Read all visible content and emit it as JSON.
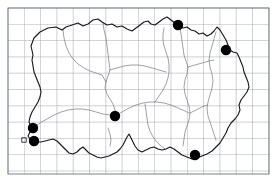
{
  "figure": {
    "kind": "distribution-dot-map",
    "title": "",
    "caption": "",
    "background_color": "#ffffff"
  },
  "colors": {
    "grid_line": "#9aa3b0",
    "grid_frame": "#6b7280",
    "coastline": "#1a1a1a",
    "internal_boundary": "#6e6e6e",
    "record_dot": "#000000"
  },
  "grid": {
    "visible": true,
    "x0": 8,
    "y0": 8,
    "x1": 269,
    "y1": 174,
    "cell_size": 16.3,
    "columns": 16,
    "rows": 10,
    "frame_visible": true
  },
  "chart_data": {
    "type": "scatter",
    "title": "",
    "xlabel": "",
    "ylabel": "",
    "xlim": [
      8,
      269
    ],
    "ylim": [
      8,
      174
    ],
    "grid": true,
    "legend": null,
    "series": [
      {
        "name": "records",
        "marker": "filled-circle",
        "marker_size": 5.2,
        "color": "#000000",
        "points": [
          {
            "label": "record-1",
            "x": 178,
            "y": 25
          },
          {
            "label": "record-2",
            "x": 226,
            "y": 50
          },
          {
            "label": "record-3",
            "x": 115,
            "y": 116
          },
          {
            "label": "record-4",
            "x": 33,
            "y": 128
          },
          {
            "label": "record-5",
            "x": 34,
            "y": 141
          },
          {
            "label": "record-6",
            "x": 195,
            "y": 155
          }
        ]
      },
      {
        "name": "minor-records",
        "marker": "open-square",
        "marker_size": 2.2,
        "color": "#111111",
        "points": [
          {
            "label": "minor-1",
            "x": 24,
            "y": 140
          }
        ]
      }
    ]
  },
  "map_geometry": {
    "coastline_label": "region-coastline",
    "coastline_path": "M 33 55 L 31 46 L 34 38 L 40 32 L 48 28 L 56 27 L 62 30 L 66 27 L 72 25 L 78 23 L 83 26 L 88 24 L 93 20 L 98 19 L 102 22 L 107 25 L 112 24 L 117 27 L 122 26 L 127 29 L 132 31 L 136 28 L 140 25 L 144 22 L 148 21 L 151 24 L 155 25 L 159 22 L 163 19 L 167 17 L 171 20 L 175 23 L 179 26 L 183 28 L 187 27 L 191 30 L 195 31 L 199 34 L 203 33 L 207 36 L 211 34 L 214 31 L 217 27 L 220 30 L 223 35 L 226 40 L 228 45 L 230 50 L 233 52 L 237 53 L 239 57 L 241 62 L 243 67 L 244 72 L 246 77 L 248 82 L 249 87 L 247 92 L 244 96 L 241 100 L 239 105 L 240 110 L 238 115 L 235 119 L 231 123 L 228 128 L 226 133 L 223 138 L 220 143 L 216 147 L 212 151 L 207 154 L 202 156 L 197 158 L 192 159 L 187 157 L 182 155 L 178 152 L 174 149 L 170 147 L 166 149 L 162 150 L 158 149 L 154 147 L 150 148 L 146 150 L 142 152 L 138 150 L 135 146 L 133 142 L 131 138 L 129 134 L 127 137 L 125 141 L 123 145 L 120 149 L 117 152 L 113 154 L 109 156 L 105 157 L 101 158 L 97 157 L 93 155 L 89 153 L 86 150 L 83 147 L 80 149 L 77 152 L 73 154 L 69 153 L 66 150 L 63 147 L 60 144 L 57 141 L 53 139 L 49 140 L 45 141 L 41 142 L 37 142 L 33 141 L 30 139 L 28 136 L 30 132 L 33 129 L 31 126 L 29 122 L 30 117 L 32 112 L 35 107 L 38 102 L 40 97 L 41 92 L 40 87 L 38 82 L 36 77 L 34 72 L 33 66 L 32 60 Z",
    "boundaries": [
      {
        "label": "boundary-north-central",
        "path": "M 103 23 L 104 30 L 106 38 L 107 46 L 108 54 L 109 62 L 110 70 L 108 76 L 106 82 L 105 88 L 107 94 L 110 99 L 113 104 L 115 110 L 116 116"
      },
      {
        "label": "boundary-northeast",
        "path": "M 180 27 L 181 34 L 182 41 L 183 48 L 184 55 L 186 61 L 188 67 L 187 74 L 185 80 L 184 87 L 185 94 L 187 100 L 189 106 L 190 113 L 189 120 L 187 126 L 185 132 L 184 139 L 183 146"
      },
      {
        "label": "boundary-mid-east",
        "path": "M 116 116 L 122 112 L 129 108 L 136 105 L 143 103 L 150 102 L 157 102 L 164 103 L 171 105 L 178 108 L 185 111 L 189 113"
      },
      {
        "label": "boundary-west-interior",
        "path": "M 33 128 L 40 123 L 47 119 L 54 115 L 61 112 L 68 110 L 75 109 L 82 109 L 89 110 L 96 112 L 103 114 L 110 115 L 116 116"
      },
      {
        "label": "boundary-northwest-arm",
        "path": "M 63 30 L 64 38 L 66 46 L 69 53 L 73 59 L 78 64 L 84 68 L 90 71 L 96 73 L 102 75 L 106 82"
      },
      {
        "label": "boundary-east-interior",
        "path": "M 216 32 L 214 39 L 212 46 L 210 53 L 209 60 L 210 67 L 212 74 L 213 81 L 212 88 L 210 95 L 208 102 L 207 109 L 208 116 L 210 122 L 212 128 L 214 134 L 216 140"
      },
      {
        "label": "boundary-south-central",
        "path": "M 145 104 L 146 111 L 147 118 L 148 125 L 150 131 L 153 137 L 157 142 L 161 146 L 165 149"
      },
      {
        "label": "boundary-central-spur",
        "path": "M 155 102 L 159 96 L 163 90 L 166 84 L 168 78 L 169 72 L 169 65 L 168 58 L 166 52 L 164 46 L 163 40 L 163 34 L 164 28"
      },
      {
        "label": "boundary-upper-mid",
        "path": "M 110 70 L 117 68 L 124 66 L 131 65 L 138 65 L 145 66 L 152 68 L 159 70 L 166 72"
      },
      {
        "label": "boundary-ne-inner",
        "path": "M 188 67 L 195 65 L 202 63 L 209 61 L 214 60"
      },
      {
        "label": "boundary-se-inner",
        "path": "M 190 113 L 196 110 L 202 107 L 207 105"
      },
      {
        "label": "boundary-sw-inlet",
        "path": "M 108 128 L 110 134 L 111 140 L 110 146"
      }
    ]
  }
}
